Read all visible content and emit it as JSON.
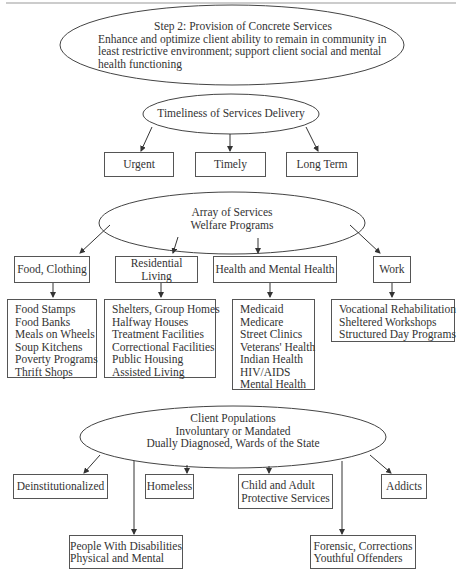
{
  "step": {
    "title": "Step 2: Provision of Concrete Services",
    "lines": [
      "Enhance and optimize client ability to remain in community in",
      "least restrictive environment; support client social and mental",
      "health functioning"
    ]
  },
  "timeliness": {
    "title": "Timeliness of Services Delivery",
    "items": [
      "Urgent",
      "Timely",
      "Long Term"
    ]
  },
  "array": {
    "title_1": "Array of Services",
    "title_2": "Welfare Programs",
    "categories": [
      {
        "label": "Food, Clothing",
        "items": [
          "Food Stamps",
          "Food Banks",
          "Meals on Wheels",
          "Soup Kitchens",
          "Poverty Programs",
          "Thrift Shops"
        ]
      },
      {
        "label": "Residential Living",
        "items": [
          "Shelters, Group Homes",
          "Halfway Houses",
          "Treatment Facilities",
          "Correctional Facilities",
          "Public Housing",
          "Assisted Living"
        ]
      },
      {
        "label": "Health and Mental Health",
        "items": [
          "Medicaid",
          "Medicare",
          "Street Clinics",
          "Veterans' Health",
          "Indian Health",
          "HIV/AIDS",
          "Mental Health"
        ]
      },
      {
        "label": "Work",
        "items": [
          "Vocational Rehabilitation",
          "Sheltered Workshops",
          "Structured Day Programs"
        ]
      }
    ]
  },
  "clients": {
    "title_1": "Client Populations",
    "title_2": "Involuntary or Mandated",
    "title_3": "Dually Diagnosed, Wards of the State",
    "groups": [
      {
        "line_1": "Deinstitutionalized"
      },
      {
        "line_1": "Homeless"
      },
      {
        "line_1": "Child and Adult",
        "line_2": "Protective Services"
      },
      {
        "line_1": "Addicts"
      },
      {
        "line_1": "People With Disabilities",
        "line_2": "Physical and Mental"
      },
      {
        "line_1": "Forensic, Corrections",
        "line_2": "Youthful Offenders"
      }
    ]
  }
}
